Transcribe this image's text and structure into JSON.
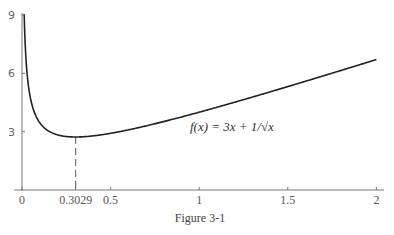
{
  "chart_data": {
    "type": "line",
    "title": "",
    "caption": "Figure 3-1",
    "xlabel": "",
    "ylabel": "",
    "xlim": [
      0,
      2.05
    ],
    "ylim": [
      0,
      9
    ],
    "grid": false,
    "x_ticks": [
      {
        "value": 0,
        "label": "0"
      },
      {
        "value": 0.3029,
        "label": "0.3029"
      },
      {
        "value": 0.5,
        "label": "0.5"
      },
      {
        "value": 1,
        "label": "1"
      },
      {
        "value": 1.5,
        "label": "1.5"
      },
      {
        "value": 2,
        "label": "2"
      }
    ],
    "y_ticks": [
      {
        "value": 3,
        "label": "3"
      },
      {
        "value": 6,
        "label": "6"
      },
      {
        "value": 9,
        "label": "9"
      }
    ],
    "series": [
      {
        "name": "f(x) = 3x + 1/√x",
        "function": "3x + 1/sqrt(x)",
        "x": [
          0.0123,
          0.02,
          0.05,
          0.1,
          0.2,
          0.3029,
          0.5,
          0.75,
          1,
          1.25,
          1.5,
          1.75,
          2
        ],
        "values": [
          9.0,
          7.13,
          4.62,
          3.46,
          2.84,
          2.726,
          2.91,
          3.4,
          4.0,
          4.64,
          5.32,
          6.01,
          6.71
        ]
      }
    ],
    "annotations": [
      {
        "type": "label",
        "text": "f(x) = 3x + 1/√x",
        "x": 0.95,
        "y": 3.0
      },
      {
        "type": "dashed-vline",
        "x": 0.3029,
        "y_from": 0,
        "y_to": 2.726,
        "note": "minimum"
      }
    ]
  },
  "labels": {
    "formula": "f(x) = 3x + 1/√x",
    "caption": "Figure 3-1"
  }
}
